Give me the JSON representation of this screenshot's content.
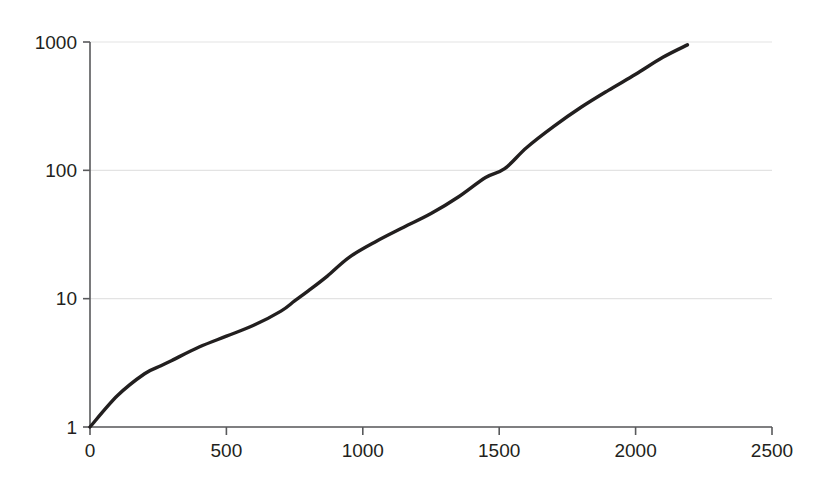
{
  "chart_data": {
    "type": "line",
    "title": "",
    "subtitle": "",
    "xlabel": "",
    "ylabel": "",
    "yscale": "log",
    "xscale": "linear",
    "xlim": [
      0,
      2500
    ],
    "ylim": [
      1,
      1000
    ],
    "grid": "horizontal",
    "legend": "none",
    "x_ticks": [
      0,
      500,
      1000,
      1500,
      2000,
      2500
    ],
    "x_tick_labels": [
      "0",
      "500",
      "1000",
      "1500",
      "2000",
      "2500"
    ],
    "y_ticks": [
      1,
      10,
      100,
      1000
    ],
    "y_tick_labels": [
      "1",
      "10",
      "100",
      "1000"
    ],
    "series": [
      {
        "name": "series-1",
        "color": "#221f1f",
        "x": [
          0,
          100,
          200,
          260,
          300,
          400,
          500,
          600,
          700,
          750,
          800,
          870,
          950,
          1050,
          1150,
          1250,
          1350,
          1450,
          1520,
          1600,
          1700,
          1800,
          1900,
          2000,
          2100,
          2190
        ],
        "y": [
          1,
          1.75,
          2.6,
          3.0,
          3.3,
          4.2,
          5.1,
          6.2,
          8.0,
          9.6,
          11.5,
          15.0,
          21.0,
          28.0,
          36.0,
          46.0,
          62.0,
          88.0,
          103.0,
          150.0,
          220.0,
          310.0,
          420.0,
          560.0,
          760.0,
          950.0
        ]
      }
    ]
  },
  "axes": {
    "y_axis_name": "logarithmic-value-axis",
    "x_axis_name": "linear-value-axis"
  },
  "colors": {
    "line": "#221f1f",
    "grid": "#e3e3e3",
    "axis": "#58595b",
    "text": "#231f20",
    "background": "#ffffff"
  }
}
